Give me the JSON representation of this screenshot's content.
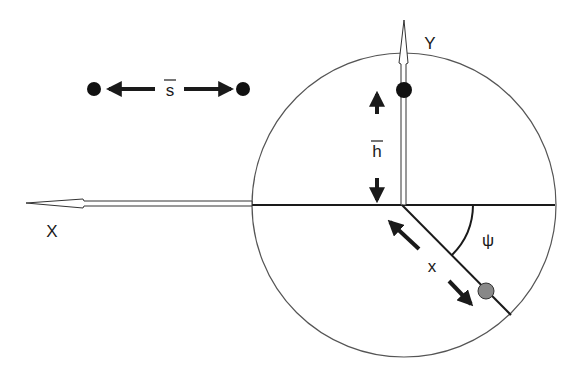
{
  "diagram": {
    "type": "geometry-schematic",
    "labels": {
      "x_axis": "X",
      "y_axis": "Y",
      "separation": "s",
      "height": "h",
      "distance": "x",
      "angle": "ψ"
    },
    "colors": {
      "stroke": "#1a1a1a",
      "circle": "#555555",
      "dot": "#111111",
      "gray_ball": "#888888",
      "background": "#ffffff"
    },
    "elements": {
      "circle": {
        "cx": 404,
        "cy": 205,
        "r": 152
      },
      "origin": {
        "x": 402,
        "y": 205
      },
      "pair_dots": [
        {
          "x": 94,
          "y": 89
        },
        {
          "x": 243,
          "y": 89
        }
      ],
      "y_axis_dot": {
        "x": 404,
        "y": 90
      },
      "gray_ball": {
        "x": 486,
        "y": 291
      },
      "angle_arc_radius": 71,
      "radial_line_angle_deg": 45
    }
  }
}
